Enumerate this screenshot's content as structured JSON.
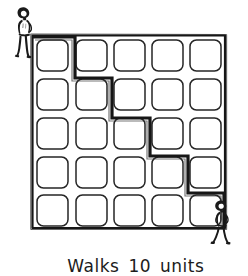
{
  "figure": {
    "caption_parts": {
      "verb": "Walks",
      "number": "10",
      "unit": "units"
    },
    "ink_color": "#161616",
    "paper_color": "#ffffff",
    "grid": {
      "rows": 5,
      "columns": 5,
      "cell_count": 25,
      "frame": {
        "x": 32,
        "y": 35,
        "width": 193,
        "height": 193
      },
      "cell_size": 33,
      "cell_corner_radius": 6
    },
    "path": {
      "label": "staircase walking route",
      "total_units": 10,
      "start": "top-left corner of grid",
      "end": "bottom-right corner of grid",
      "points": [
        [
          34,
          37
        ],
        [
          75,
          37
        ],
        [
          75,
          78
        ],
        [
          112,
          78
        ],
        [
          112,
          118
        ],
        [
          150,
          118
        ],
        [
          150,
          156
        ],
        [
          188,
          156
        ],
        [
          188,
          193
        ],
        [
          224,
          193
        ],
        [
          224,
          227
        ]
      ],
      "stroke_width": 3
    },
    "figures": [
      {
        "name": "walker-start",
        "position": "top-left",
        "x": 14,
        "y": 4
      },
      {
        "name": "walker-end",
        "position": "bottom-right",
        "x": 212,
        "y": 198
      }
    ]
  }
}
